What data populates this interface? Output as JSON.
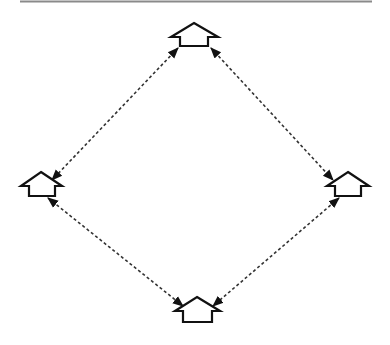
{
  "diagram": {
    "type": "network-topology",
    "colors": {
      "background": "#ffffff",
      "stroke": "#111111",
      "dash": "#333333",
      "top_rule": "#8a8a8a"
    },
    "nodes": [
      {
        "id": "top",
        "icon": "house-icon",
        "position": "top"
      },
      {
        "id": "left",
        "icon": "house-icon",
        "position": "left"
      },
      {
        "id": "right",
        "icon": "house-icon",
        "position": "right"
      },
      {
        "id": "bottom",
        "icon": "house-icon",
        "position": "bottom"
      }
    ],
    "edges": [
      {
        "from": "top",
        "to": "left",
        "style": "dashed",
        "arrows": "both"
      },
      {
        "from": "top",
        "to": "right",
        "style": "dashed",
        "arrows": "both"
      },
      {
        "from": "left",
        "to": "bottom",
        "style": "dashed",
        "arrows": "both"
      },
      {
        "from": "right",
        "to": "bottom",
        "style": "dashed",
        "arrows": "both"
      }
    ]
  }
}
